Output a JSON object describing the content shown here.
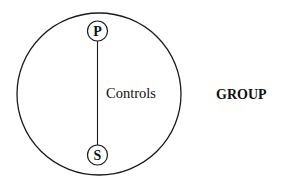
{
  "diagram": {
    "group_circle": {
      "label": "GROUP"
    },
    "nodes": [
      {
        "id": "P",
        "label": "P"
      },
      {
        "id": "S",
        "label": "S"
      }
    ],
    "edge": {
      "from": "P",
      "to": "S",
      "label": "Controls"
    },
    "colors": {
      "stroke": "#1a1a1a",
      "text": "#111111",
      "background": "#ffffff"
    }
  }
}
